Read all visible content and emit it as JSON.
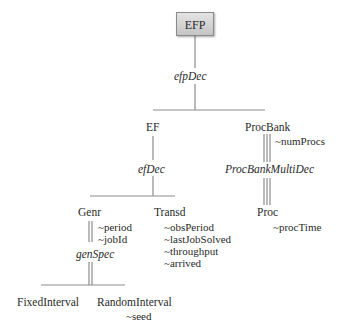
{
  "diagram": {
    "root": {
      "label": "EFP"
    },
    "decompositions": {
      "efpDec": "efpDec",
      "efDec": "efDec",
      "procBankMultiDec": "ProcBankMultiDec",
      "genSpec": "genSpec"
    },
    "nodes": {
      "ef": "EF",
      "procBank": "ProcBank",
      "proc": "Proc",
      "genr": "Genr",
      "transd": "Transd",
      "fixedInterval": "FixedInterval",
      "randomInterval": "RandomInterval"
    },
    "variables": {
      "procBank": [
        "~numProcs"
      ],
      "proc": [
        "~procTime"
      ],
      "genr": [
        "~period",
        "~jobId"
      ],
      "transd": [
        "~obsPeriod",
        "~lastJobSolved",
        "~throughput",
        "~arrived"
      ],
      "randomInterval": [
        "~seed"
      ]
    }
  }
}
